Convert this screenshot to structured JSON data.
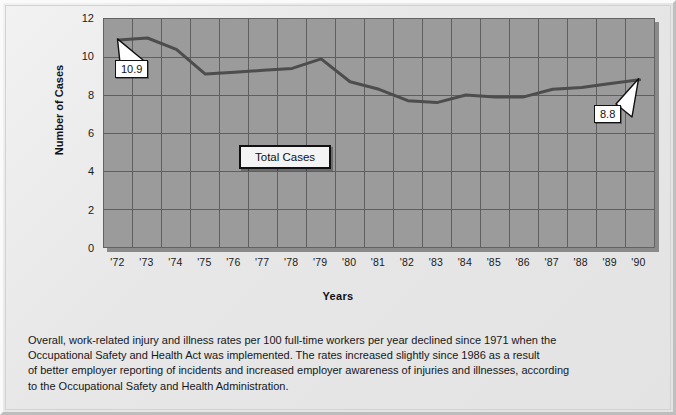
{
  "chart_data": {
    "type": "line",
    "title": "",
    "xlabel": "Years",
    "ylabel": "Number of Cases",
    "series_name": "Total Cases",
    "legend_label": "Total Cases",
    "legend_position": "inside-center",
    "grid": true,
    "xlim": [
      1972,
      1990
    ],
    "ylim": [
      0,
      12
    ],
    "ytick_values": [
      12,
      10,
      8,
      6,
      4,
      2,
      0
    ],
    "ytick_labels": [
      "12",
      "10",
      "8",
      "6",
      "4",
      "2",
      "0"
    ],
    "xtick_labels": [
      "'72",
      "'73",
      "'74",
      "'75",
      "'76",
      "'77",
      "'78",
      "'79",
      "'80",
      "'81",
      "'82",
      "'83",
      "'84",
      "'85",
      "'86",
      "'87",
      "'88",
      "'89",
      "'90"
    ],
    "categories": [
      1972,
      1973,
      1974,
      1975,
      1976,
      1977,
      1978,
      1979,
      1980,
      1981,
      1982,
      1983,
      1984,
      1985,
      1986,
      1987,
      1988,
      1989,
      1990
    ],
    "values": [
      10.9,
      11.0,
      10.4,
      9.1,
      9.2,
      9.3,
      9.4,
      9.9,
      8.7,
      8.3,
      7.7,
      7.6,
      8.0,
      7.9,
      7.9,
      8.3,
      8.4,
      8.6,
      8.8
    ],
    "annotations": [
      {
        "name": "first-point-callout",
        "label": "10.9",
        "x": 1972,
        "y": 10.9
      },
      {
        "name": "last-point-callout",
        "label": "8.8",
        "x": 1990,
        "y": 8.8
      }
    ],
    "colors": {
      "plot_background": "#9b9b9b",
      "gridline": "#5f5f5f",
      "line": "#4d4d4d",
      "page_background": "#e9e9e9",
      "text": "#15171a"
    }
  },
  "caption": {
    "line1": "Overall, work-related injury and illness rates per 100 full-time workers per year declined since 1971 when the",
    "line2": "Occupational Safety and Health Act was implemented. The rates increased slightly since 1986 as a result",
    "line3": "of better employer reporting of incidents and increased employer awareness of injuries and illnesses, according",
    "line4": "to the Occupational Safety and Health Administration."
  }
}
